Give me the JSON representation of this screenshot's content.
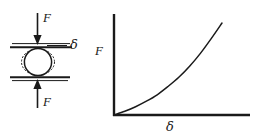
{
  "figure": {
    "background_color": "#ffffff",
    "ink_color": "#1a1a1a"
  },
  "schematic": {
    "name": "compressed-sphere-schematic",
    "top_force_label": "F",
    "bottom_force_label": "F",
    "approach_label": "δ",
    "top_plate_name": "upper-plate",
    "bottom_plate_name": "lower-plate",
    "body_name": "undeformed-sphere-outline",
    "deformed_name": "deformed-sphere-outline"
  },
  "chart_data": {
    "type": "line",
    "title": "",
    "xlabel": "δ",
    "ylabel": "F",
    "grid": false,
    "legend": false,
    "axis_ticks": [],
    "xlim": [
      0,
      1
    ],
    "ylim": [
      0,
      1
    ],
    "series": [
      {
        "name": "force-deflection-curve",
        "description": "monotonic convex increasing contact law (F grows faster than δ)",
        "x": [
          0.0,
          0.1,
          0.2,
          0.3,
          0.4,
          0.5,
          0.6,
          0.7,
          0.8,
          0.9,
          1.0
        ],
        "y": [
          0.0,
          0.04,
          0.09,
          0.15,
          0.22,
          0.31,
          0.41,
          0.53,
          0.67,
          0.83,
          1.0
        ]
      }
    ]
  }
}
